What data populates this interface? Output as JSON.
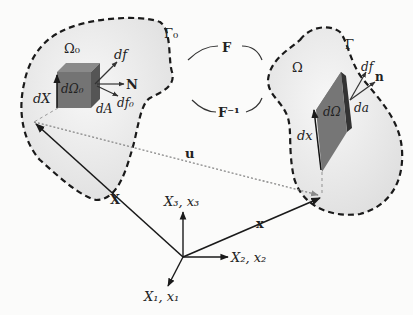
{
  "diagram": {
    "type": "continuum-mechanics-deformation",
    "reference_configuration": {
      "domain_label": "Ω₀",
      "boundary_label": "Γ₀",
      "volume_element_label": "dΩ₀",
      "line_element_label": "dX",
      "area_element_label": "dA",
      "normal_label": "N",
      "force_label": "df",
      "force0_label": "df₀"
    },
    "current_configuration": {
      "domain_label": "Ω",
      "boundary_label": "Γ",
      "volume_element_label": "dΩ",
      "line_element_label": "dx",
      "area_element_label": "da",
      "normal_label": "n",
      "force_label": "df"
    },
    "mappings": {
      "forward": "F",
      "inverse": "F⁻¹"
    },
    "vectors": {
      "reference_position": "X",
      "current_position": "x",
      "displacement": "u"
    },
    "axes": {
      "axis1": "X₁, x₁",
      "axis2": "X₂, x₂",
      "axis3": "X₃, x₃"
    },
    "colors": {
      "background": "#fbfbfa",
      "body_fill": "#ececec",
      "element_fill": "#6f6f6f",
      "element_dark": "#3e3e3e",
      "line": "#1a1a1a"
    }
  }
}
